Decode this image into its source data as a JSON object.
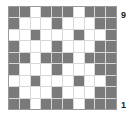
{
  "board": {
    "columns": 10,
    "rows": 9,
    "colors": {
      "dark": "#7a7a7a",
      "light": "#ffffff"
    },
    "cells": [
      "DDWDDDWDDD",
      "DWWWDWWWDD",
      "WWDWWWDWWD",
      "DWWWDWWWDD",
      "DDWDDDWDDD",
      "DWWWDWWWDD",
      "WWDWWWDWWD",
      "DWWWDWWWDD",
      "DDWDDDWDDD"
    ]
  },
  "labels": {
    "top_row": "9",
    "bottom_row": "1"
  }
}
